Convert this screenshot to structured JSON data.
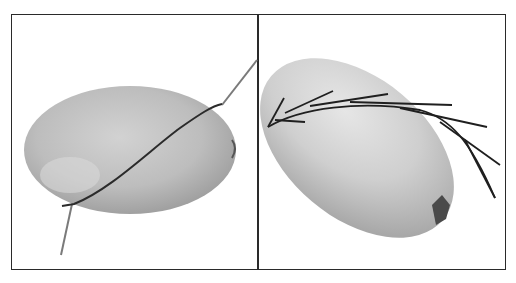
{
  "figure": {
    "panels": [
      {
        "id": "left",
        "subject": "oblong squash lying horizontally",
        "overlay": "thin stick with dark wire wrapped diagonally across"
      },
      {
        "id": "right",
        "subject": "oblong squash tilted diagonally, blossom end visible lower right",
        "overlay": "conifer twig with needles draped across top"
      }
    ],
    "colors": {
      "border": "#2a2a2a",
      "background": "#ffffff",
      "squash_light": "#d9d9d9",
      "squash_mid": "#b8b8b8",
      "squash_dark": "#8c8c8c",
      "stick": "#6e6e6e",
      "wire": "#2b2b2b",
      "needles": "#1f1f1f"
    }
  }
}
